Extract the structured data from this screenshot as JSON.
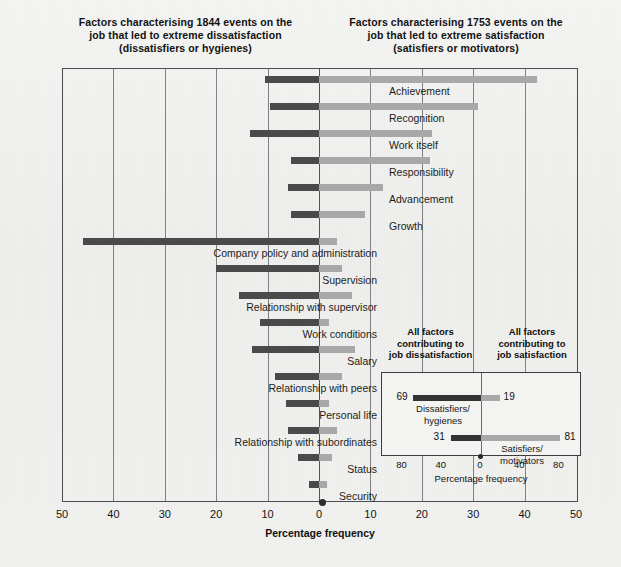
{
  "titles": {
    "left": "Factors characterising 1844 events on the job that led to extreme dissatisfaction (dissatisfiers or hygienes)",
    "left_line1": "Factors characterising 1844 events on the",
    "left_line2": "job that led to extreme dissatisfaction",
    "left_line3": "(dissatisfiers or hygienes)",
    "right_line1": "Factors characterising 1753 events on the",
    "right_line2": "job that led to extreme satisfaction",
    "right_line3": "(satisfiers or motivators)"
  },
  "axis": {
    "title": "Percentage frequency",
    "ticks": [
      "50",
      "40",
      "30",
      "20",
      "10",
      "0",
      "10",
      "20",
      "30",
      "40",
      "50"
    ],
    "min": -50,
    "max": 50
  },
  "colors": {
    "negative_bar": "#4a4a4a",
    "positive_bar": "#a8a8a8",
    "background": "#f2f2f0",
    "frame": "#4d4d4d"
  },
  "chart_data": {
    "type": "bar",
    "orientation": "horizontal-diverging",
    "xlabel": "Percentage frequency",
    "ylabel": "",
    "xlim": [
      -50,
      50
    ],
    "grid": true,
    "legend_position": "none",
    "categories": [
      "Achievement",
      "Recognition",
      "Work itself",
      "Responsibility",
      "Advancement",
      "Growth",
      "Company policy and administration",
      "Supervision",
      "Relationship with supervisor",
      "Work conditions",
      "Salary",
      "Relationship with peers",
      "Personal life",
      "Relationship with subordinates",
      "Status",
      "Security"
    ],
    "label_side": [
      "right",
      "right",
      "right",
      "right",
      "right",
      "right",
      "left",
      "left",
      "left",
      "left",
      "left",
      "left",
      "left",
      "left",
      "left",
      "left"
    ],
    "series": [
      {
        "name": "Factors leading to extreme dissatisfaction",
        "direction": "left",
        "color": "#4a4a4a",
        "values": [
          10.5,
          9.5,
          13.5,
          5.5,
          6.0,
          5.5,
          46.0,
          20.0,
          15.5,
          11.5,
          13.0,
          8.5,
          6.5,
          6.0,
          4.0,
          2.0
        ]
      },
      {
        "name": "Factors leading to extreme satisfaction",
        "direction": "right",
        "color": "#a8a8a8",
        "values": [
          42.5,
          31.0,
          22.0,
          21.5,
          12.5,
          9.0,
          3.5,
          4.5,
          6.5,
          2.0,
          7.0,
          4.5,
          2.0,
          3.5,
          2.5,
          1.5
        ]
      }
    ]
  },
  "inset": {
    "heading_left_line1": "All factors",
    "heading_left_line2": "contributing to",
    "heading_left_line3": "job dissatisfaction",
    "heading_right_line1": "All factors",
    "heading_right_line2": "contributing to",
    "heading_right_line3": "job satisfaction",
    "axis_title": "Percentage frequency",
    "ticks": [
      "80",
      "40",
      "0",
      "40",
      "80"
    ],
    "chart_data": {
      "type": "bar",
      "orientation": "horizontal-diverging",
      "xlabel": "Percentage frequency",
      "xlim": [
        -100,
        100
      ],
      "categories": [
        "Dissatisfiers/ hygienes",
        "Satisfiers/ motivators"
      ],
      "series": [
        {
          "name": "Contributing to job dissatisfaction",
          "direction": "left",
          "color": "#333333",
          "values": [
            69,
            31
          ]
        },
        {
          "name": "Contributing to job satisfaction",
          "direction": "right",
          "color": "#a8a8a8",
          "values": [
            19,
            81
          ]
        }
      ]
    },
    "rows": [
      {
        "name_line1": "Dissatisfiers/",
        "name_line2": "hygienes",
        "left_value": "69",
        "right_value": "19"
      },
      {
        "name_line1": "Satisfiers/",
        "name_line2": "motivators",
        "left_value": "31",
        "right_value": "81"
      }
    ]
  }
}
